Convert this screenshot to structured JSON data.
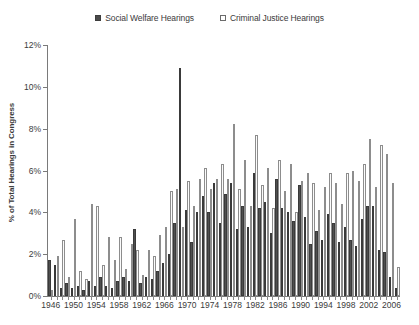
{
  "chart_data": {
    "type": "bar",
    "title": "",
    "xlabel": "",
    "ylabel": "% of Total Hearings in Congress",
    "ylim": [
      0,
      12
    ],
    "ytick_labels": [
      "0%",
      "2%",
      "4%",
      "6%",
      "8%",
      "10%",
      "12%"
    ],
    "ytick_values": [
      0,
      2,
      4,
      6,
      8,
      10,
      12
    ],
    "xlim": [
      1946,
      2007
    ],
    "xtick_labels": [
      "1946",
      "1950",
      "1954",
      "1958",
      "1962",
      "1966",
      "1970",
      "1974",
      "1978",
      "1982",
      "1986",
      "1990",
      "1994",
      "1998",
      "2002",
      "2006"
    ],
    "xtick_values": [
      1946,
      1950,
      1954,
      1958,
      1962,
      1966,
      1970,
      1974,
      1978,
      1982,
      1986,
      1990,
      1994,
      1998,
      2002,
      2006
    ],
    "grid": false,
    "legend_position": "top-center",
    "categories": [
      1946,
      1947,
      1948,
      1949,
      1950,
      1951,
      1952,
      1953,
      1954,
      1955,
      1956,
      1957,
      1958,
      1959,
      1960,
      1961,
      1962,
      1963,
      1964,
      1965,
      1966,
      1967,
      1968,
      1969,
      1970,
      1971,
      1972,
      1973,
      1974,
      1975,
      1976,
      1977,
      1978,
      1979,
      1980,
      1981,
      1982,
      1983,
      1984,
      1985,
      1986,
      1987,
      1988,
      1989,
      1990,
      1991,
      1992,
      1993,
      1994,
      1995,
      1996,
      1997,
      1998,
      1999,
      2000,
      2001,
      2002,
      2003,
      2004,
      2005,
      2006,
      2007
    ],
    "series": [
      {
        "name": "Social Welfare Hearings",
        "color": "#4f4f4f",
        "marker": "filled-square",
        "values": [
          1.7,
          1.5,
          0.4,
          0.6,
          0.4,
          0.5,
          0.3,
          0.7,
          0.5,
          0.9,
          0.5,
          0.4,
          0.7,
          0.9,
          0.7,
          3.2,
          0.6,
          0.9,
          0.8,
          1.2,
          1.6,
          2.0,
          3.5,
          10.9,
          4.1,
          2.6,
          4.0,
          4.8,
          4.0,
          5.4,
          3.5,
          4.9,
          5.4,
          3.2,
          4.3,
          3.3,
          5.9,
          4.2,
          4.5,
          3.0,
          5.6,
          4.2,
          4.0,
          3.6,
          5.3,
          3.8,
          2.5,
          3.1,
          2.7,
          3.9,
          3.5,
          2.6,
          3.3,
          2.7,
          2.4,
          3.7,
          4.3,
          4.3,
          2.2,
          2.1,
          0.9,
          0.4
        ]
      },
      {
        "name": "Criminal Justice Hearings",
        "color": "#fbfbfb",
        "marker": "hollow-square",
        "values": [
          0.3,
          1.9,
          2.7,
          0.9,
          3.7,
          1.2,
          0.8,
          4.4,
          4.3,
          1.5,
          2.8,
          1.7,
          2.8,
          1.3,
          2.5,
          2.2,
          1.0,
          2.2,
          1.9,
          2.9,
          3.3,
          5.0,
          5.1,
          3.3,
          5.5,
          4.3,
          5.6,
          6.1,
          5.1,
          5.6,
          6.3,
          5.6,
          8.2,
          5.1,
          6.5,
          4.3,
          7.7,
          5.3,
          6.1,
          4.2,
          6.5,
          5.0,
          6.3,
          4.0,
          5.5,
          5.9,
          5.4,
          4.1,
          5.2,
          5.9,
          5.4,
          4.4,
          5.9,
          6.0,
          5.5,
          6.3,
          7.5,
          5.2,
          7.2,
          6.8,
          5.4,
          1.4
        ]
      }
    ]
  },
  "legend": {
    "entries": [
      {
        "label": "Social Welfare Hearings",
        "swatch": "filled-square"
      },
      {
        "label": "Criminal Justice Hearings",
        "swatch": "hollow-square"
      }
    ]
  },
  "axis": {
    "y_title": "% of Total Hearings in Congress"
  }
}
